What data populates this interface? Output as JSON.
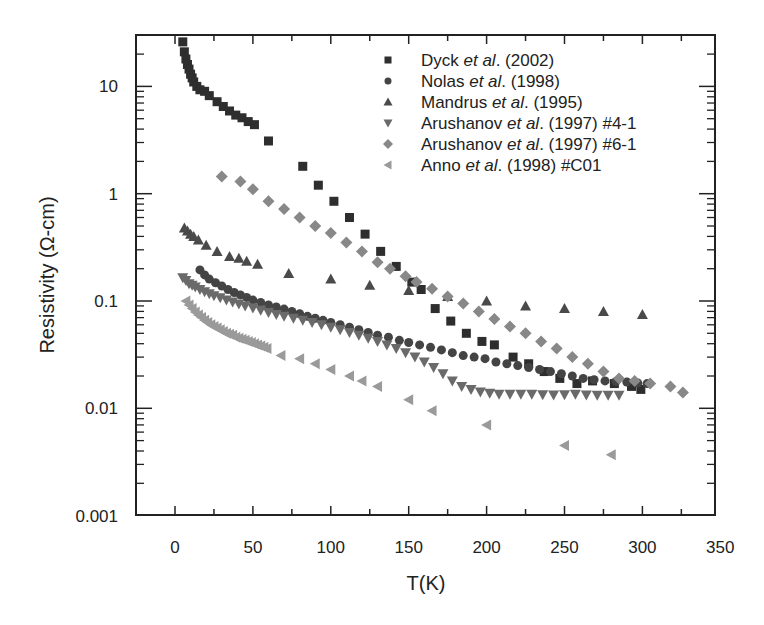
{
  "chart_data": {
    "type": "scatter",
    "title": "",
    "xlabel": "T(K)",
    "ylabel": "Resistivity (Ω-cm)",
    "xlim": [
      -25,
      345
    ],
    "ylim": [
      0.001,
      28
    ],
    "yscale": "log",
    "xticks": [
      0,
      50,
      100,
      150,
      200,
      250,
      300,
      350
    ],
    "xtick_labels": [
      "0",
      "50",
      "100",
      "150",
      "200",
      "250",
      "300",
      "350"
    ],
    "yticks": [
      0.001,
      0.01,
      0.1,
      1,
      10
    ],
    "ytick_labels": [
      "0.001",
      "0.01",
      "0.1",
      "1",
      "10"
    ],
    "grid": false,
    "legend_position": "upper right (inside)",
    "series": [
      {
        "name": "Dyck et al. (2002)",
        "label_parts": [
          "Dyck ",
          "et al",
          ". (2002)"
        ],
        "marker": "square",
        "color": "#2e2e2e",
        "points": [
          [
            5,
            26
          ],
          [
            6,
            21
          ],
          [
            7,
            18
          ],
          [
            8,
            16
          ],
          [
            9,
            14.5
          ],
          [
            10,
            13
          ],
          [
            11,
            12
          ],
          [
            12,
            11
          ],
          [
            14,
            10
          ],
          [
            16,
            9.3
          ],
          [
            19,
            9
          ],
          [
            22,
            8.2
          ],
          [
            27,
            7.2
          ],
          [
            31,
            6.5
          ],
          [
            35,
            5.9
          ],
          [
            39,
            5.4
          ],
          [
            43,
            5.1
          ],
          [
            47,
            4.7
          ],
          [
            51,
            4.4
          ],
          [
            60,
            3.1
          ],
          [
            82,
            1.8
          ],
          [
            92,
            1.2
          ],
          [
            102,
            0.85
          ],
          [
            112,
            0.6
          ],
          [
            122,
            0.42
          ],
          [
            132,
            0.29
          ],
          [
            142,
            0.21
          ],
          [
            152,
            0.15
          ],
          [
            158,
            0.128
          ],
          [
            167,
            0.085
          ],
          [
            177,
            0.065
          ],
          [
            187,
            0.05
          ],
          [
            197,
            0.042
          ],
          [
            205,
            0.039
          ],
          [
            217,
            0.03
          ],
          [
            227,
            0.026
          ],
          [
            237,
            0.022
          ],
          [
            247,
            0.019
          ],
          [
            258,
            0.017
          ],
          [
            268,
            0.018
          ],
          [
            282,
            0.017
          ],
          [
            293,
            0.016
          ],
          [
            299,
            0.015
          ]
        ]
      },
      {
        "name": "Nolas et al. (1998)",
        "label_parts": [
          "Nolas ",
          "et al",
          ". (1998)"
        ],
        "marker": "circle",
        "color": "#444444",
        "points": [
          [
            16,
            0.195
          ],
          [
            19,
            0.175
          ],
          [
            22,
            0.16
          ],
          [
            26,
            0.148
          ],
          [
            30,
            0.138
          ],
          [
            34,
            0.128
          ],
          [
            38,
            0.12
          ],
          [
            42,
            0.114
          ],
          [
            46,
            0.108
          ],
          [
            50,
            0.102
          ],
          [
            55,
            0.097
          ],
          [
            60,
            0.092
          ],
          [
            65,
            0.088
          ],
          [
            70,
            0.084
          ],
          [
            75,
            0.08
          ],
          [
            80,
            0.076
          ],
          [
            85,
            0.072
          ],
          [
            90,
            0.069
          ],
          [
            95,
            0.066
          ],
          [
            100,
            0.063
          ],
          [
            106,
            0.06
          ],
          [
            112,
            0.057
          ],
          [
            118,
            0.054
          ],
          [
            124,
            0.051
          ],
          [
            130,
            0.048
          ],
          [
            137,
            0.046
          ],
          [
            144,
            0.043
          ],
          [
            150,
            0.041
          ],
          [
            157,
            0.039
          ],
          [
            164,
            0.037
          ],
          [
            171,
            0.035
          ],
          [
            178,
            0.033
          ],
          [
            185,
            0.031
          ],
          [
            192,
            0.03
          ],
          [
            199,
            0.029
          ],
          [
            206,
            0.027
          ],
          [
            213,
            0.026
          ],
          [
            220,
            0.025
          ],
          [
            227,
            0.024
          ],
          [
            234,
            0.023
          ],
          [
            241,
            0.022
          ],
          [
            248,
            0.021
          ],
          [
            255,
            0.02
          ],
          [
            262,
            0.019
          ],
          [
            269,
            0.0185
          ],
          [
            276,
            0.018
          ],
          [
            283,
            0.0178
          ],
          [
            290,
            0.0176
          ],
          [
            297,
            0.0172
          ],
          [
            303,
            0.017
          ]
        ]
      },
      {
        "name": "Mandrus et al. (1995)",
        "label_parts": [
          "Mandrus ",
          "et al",
          ". (1995)"
        ],
        "marker": "triangle-up",
        "color": "#4a4a4a",
        "points": [
          [
            6,
            0.48
          ],
          [
            8,
            0.45
          ],
          [
            10,
            0.42
          ],
          [
            12,
            0.4
          ],
          [
            15,
            0.37
          ],
          [
            20,
            0.33
          ],
          [
            27,
            0.29
          ],
          [
            35,
            0.26
          ],
          [
            41,
            0.25
          ],
          [
            46,
            0.235
          ],
          [
            53,
            0.22
          ],
          [
            73,
            0.18
          ],
          [
            100,
            0.16
          ],
          [
            125,
            0.14
          ],
          [
            150,
            0.125
          ],
          [
            175,
            0.11
          ],
          [
            200,
            0.1
          ],
          [
            225,
            0.09
          ],
          [
            250,
            0.085
          ],
          [
            275,
            0.08
          ],
          [
            300,
            0.075
          ]
        ]
      },
      {
        "name": "Arushanov et al. (1997) #4-1",
        "label_parts": [
          "Arushanov ",
          "et al",
          ". (1997) #4-1"
        ],
        "marker": "triangle-down",
        "color": "#6a6a6a",
        "points": [
          [
            5,
            0.165
          ],
          [
            7,
            0.155
          ],
          [
            9,
            0.145
          ],
          [
            11,
            0.14
          ],
          [
            13,
            0.135
          ],
          [
            16,
            0.128
          ],
          [
            19,
            0.122
          ],
          [
            22,
            0.117
          ],
          [
            25,
            0.112
          ],
          [
            29,
            0.107
          ],
          [
            33,
            0.102
          ],
          [
            37,
            0.098
          ],
          [
            41,
            0.094
          ],
          [
            45,
            0.09
          ],
          [
            50,
            0.086
          ],
          [
            55,
            0.082
          ],
          [
            60,
            0.078
          ],
          [
            65,
            0.075
          ],
          [
            70,
            0.072
          ],
          [
            76,
            0.069
          ],
          [
            82,
            0.066
          ],
          [
            88,
            0.063
          ],
          [
            94,
            0.06
          ],
          [
            100,
            0.057
          ],
          [
            106,
            0.054
          ],
          [
            112,
            0.051
          ],
          [
            118,
            0.048
          ],
          [
            124,
            0.045
          ],
          [
            130,
            0.042
          ],
          [
            136,
            0.039
          ],
          [
            142,
            0.036
          ],
          [
            148,
            0.033
          ],
          [
            154,
            0.03
          ],
          [
            160,
            0.027
          ],
          [
            166,
            0.024
          ],
          [
            172,
            0.021
          ],
          [
            178,
            0.018
          ],
          [
            184,
            0.016
          ],
          [
            190,
            0.015
          ],
          [
            196,
            0.0142
          ],
          [
            202,
            0.0138
          ],
          [
            208,
            0.0135
          ],
          [
            215,
            0.0135
          ],
          [
            222,
            0.0135
          ],
          [
            229,
            0.0135
          ],
          [
            236,
            0.0134
          ],
          [
            243,
            0.0133
          ],
          [
            250,
            0.0134
          ],
          [
            257,
            0.0135
          ],
          [
            264,
            0.0133
          ],
          [
            271,
            0.0132
          ],
          [
            278,
            0.0132
          ],
          [
            285,
            0.0132
          ]
        ]
      },
      {
        "name": "Arushanov et al. (1997) #6-1",
        "label_parts": [
          "Arushanov ",
          "et al",
          ". (1997) #6-1"
        ],
        "marker": "diamond",
        "color": "#888888",
        "points": [
          [
            30,
            1.45
          ],
          [
            42,
            1.3
          ],
          [
            50,
            1.1
          ],
          [
            60,
            0.85
          ],
          [
            70,
            0.72
          ],
          [
            80,
            0.6
          ],
          [
            90,
            0.5
          ],
          [
            100,
            0.43
          ],
          [
            110,
            0.35
          ],
          [
            120,
            0.29
          ],
          [
            130,
            0.23
          ],
          [
            138,
            0.2
          ],
          [
            148,
            0.17
          ],
          [
            155,
            0.15
          ],
          [
            165,
            0.13
          ],
          [
            175,
            0.11
          ],
          [
            185,
            0.095
          ],
          [
            195,
            0.08
          ],
          [
            205,
            0.068
          ],
          [
            215,
            0.058
          ],
          [
            225,
            0.05
          ],
          [
            235,
            0.042
          ],
          [
            245,
            0.036
          ],
          [
            255,
            0.03
          ],
          [
            265,
            0.026
          ],
          [
            275,
            0.022
          ],
          [
            285,
            0.019
          ],
          [
            295,
            0.018
          ],
          [
            305,
            0.017
          ],
          [
            318,
            0.016
          ],
          [
            326,
            0.014
          ]
        ]
      },
      {
        "name": "Anno et al. (1998) #C01",
        "label_parts": [
          "Anno ",
          "et al",
          ". (1998) #C01"
        ],
        "marker": "triangle-left",
        "color": "#9a9a9a",
        "points": [
          [
            7,
            0.1
          ],
          [
            9,
            0.092
          ],
          [
            11,
            0.085
          ],
          [
            13,
            0.079
          ],
          [
            15,
            0.074
          ],
          [
            17,
            0.07
          ],
          [
            19,
            0.066
          ],
          [
            21,
            0.063
          ],
          [
            23,
            0.06
          ],
          [
            25,
            0.058
          ],
          [
            27,
            0.056
          ],
          [
            29,
            0.054
          ],
          [
            31,
            0.052
          ],
          [
            33,
            0.05
          ],
          [
            35,
            0.049
          ],
          [
            37,
            0.048
          ],
          [
            39,
            0.046
          ],
          [
            41,
            0.045
          ],
          [
            43,
            0.044
          ],
          [
            45,
            0.043
          ],
          [
            47,
            0.042
          ],
          [
            49,
            0.041
          ],
          [
            51,
            0.04
          ],
          [
            53,
            0.039
          ],
          [
            55,
            0.038
          ],
          [
            57,
            0.037
          ],
          [
            59,
            0.036
          ],
          [
            68,
            0.031
          ],
          [
            80,
            0.029
          ],
          [
            90,
            0.026
          ],
          [
            100,
            0.023
          ],
          [
            112,
            0.02
          ],
          [
            120,
            0.018
          ],
          [
            130,
            0.016
          ],
          [
            150,
            0.012
          ],
          [
            165,
            0.0095
          ],
          [
            200,
            0.007
          ],
          [
            250,
            0.0045
          ],
          [
            280,
            0.0037
          ]
        ]
      }
    ]
  }
}
